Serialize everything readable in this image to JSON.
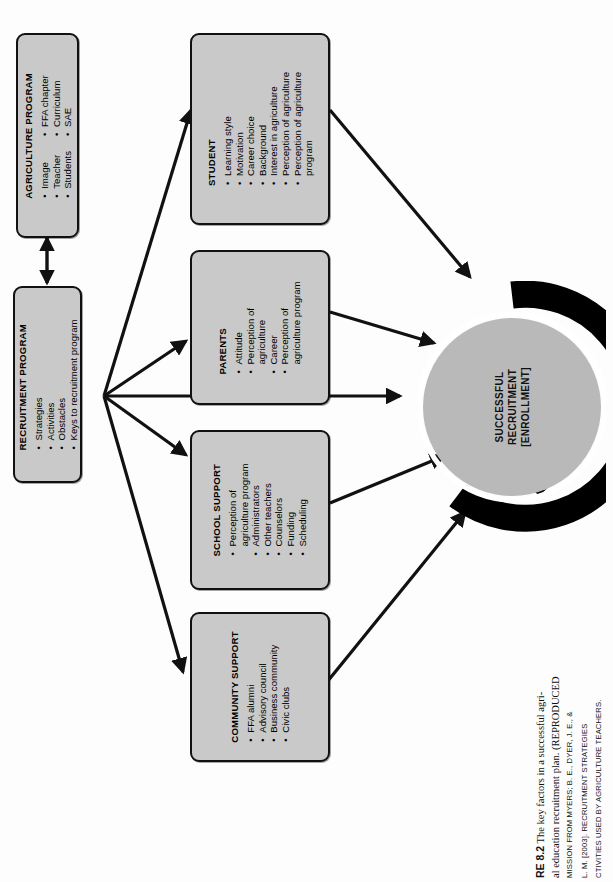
{
  "figure": {
    "circle": {
      "label_lines": [
        "SUCCESSFUL",
        "RECRUITMENT",
        "[ENROLLMENT]"
      ],
      "ring_color": "#000000",
      "fill_color": "#b9b9b9"
    },
    "box_fill": "#c9c9c9",
    "box_border": "#111111",
    "boxes": [
      {
        "id": "agriculture-program",
        "title": "AGRICULTURE PROGRAM",
        "columns": [
          [
            "Image",
            "Teacher",
            "Students"
          ],
          [
            "FFA chapter",
            "Curriculum",
            "SAE"
          ]
        ]
      },
      {
        "id": "recruitment-program",
        "title": "RECRUITMENT PROGRAM",
        "items": [
          "Strategies",
          "Activities",
          "Obstacles",
          "Keys to recruitment program"
        ]
      },
      {
        "id": "student",
        "title": "STUDENT",
        "items": [
          "Learning style",
          "Motivation",
          "Career choice",
          "Background",
          "Interest in agriculture",
          "Perception of agriculture",
          "Perception of agriculture"
        ],
        "continuation": "program"
      },
      {
        "id": "parents",
        "title": "PARENTS",
        "items": [
          "Attitude",
          "Perception of",
          "Career",
          "Perception of"
        ],
        "wraps": {
          "1": "agriculture",
          "3": "agriculture program"
        }
      },
      {
        "id": "school-support",
        "title": "SCHOOL SUPPORT",
        "items": [
          "Perception of",
          "Administrators",
          "Other teachers",
          "Counselors",
          "Funding",
          "Scheduling"
        ],
        "wraps": {
          "0": "agriculture program"
        }
      },
      {
        "id": "community-support",
        "title": "COMMUNITY SUPPORT",
        "items": [
          "FFA alumni",
          "Advisory council",
          "Business community",
          "Civic clubs"
        ]
      }
    ]
  },
  "caption": {
    "number": "RE 8.2",
    "title": "The key factors in a successful agri-",
    "line2": "al education recruitment plan. (REPRODUCED",
    "line3": "MISSION FROM MYERS; B. E., DYER, J. E., &",
    "line4": "L. M. [2003]. RECRUITMENT STRATEGIES",
    "line5": "CTIVITIES USED BY AGRICULTURE TEACHERS."
  }
}
